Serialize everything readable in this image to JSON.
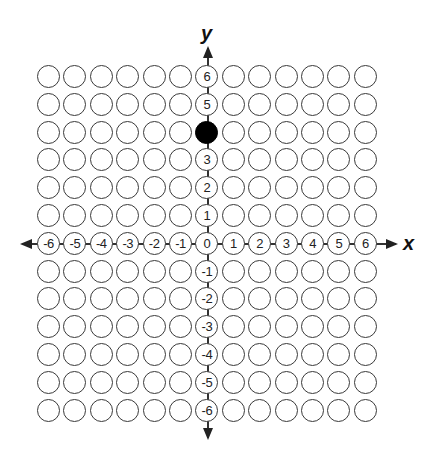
{
  "chart_data": {
    "type": "scatter",
    "title": "",
    "xlabel": "x",
    "ylabel": "y",
    "x_ticks": [
      -6,
      -5,
      -4,
      -3,
      -2,
      -1,
      0,
      1,
      2,
      3,
      4,
      5,
      6
    ],
    "y_ticks": [
      -6,
      -5,
      -4,
      -3,
      -2,
      -1,
      0,
      1,
      2,
      3,
      4,
      5,
      6
    ],
    "xlim": [
      -6,
      6
    ],
    "ylim": [
      -6,
      6
    ],
    "grid": "13x13 circle lattice",
    "points": [
      {
        "x": 0,
        "y": 4,
        "filled": true
      }
    ]
  },
  "axes": {
    "x_label": "x",
    "y_label": "y"
  },
  "colors": {
    "stroke": "#3a3a3a",
    "filled": "#000000",
    "background": "#ffffff"
  },
  "layout": {
    "col_start": 49,
    "col_pitch": 26.4,
    "row_start": 77,
    "row_pitch": 27.8
  }
}
